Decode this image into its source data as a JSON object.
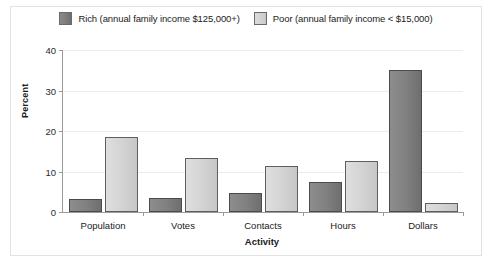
{
  "chart_data": {
    "type": "bar",
    "title": "",
    "xlabel": "Activity",
    "ylabel": "Percent",
    "ylim": [
      0,
      40
    ],
    "yticks": [
      0,
      10,
      20,
      30,
      40
    ],
    "ytick_labels": [
      "0",
      "10",
      "20",
      "30",
      "40"
    ],
    "grid": true,
    "legend_position": "top-center",
    "categories": [
      "Population",
      "Votes",
      "Contacts",
      "Hours",
      "Dollars"
    ],
    "series": [
      {
        "name": "Rich (annual family income $125,000+)",
        "color": "#7d7d7d",
        "values": [
          3.2,
          3.5,
          4.6,
          7.3,
          35.0
        ]
      },
      {
        "name": "Poor (annual family income < $15,000)",
        "color": "#d2d2d2",
        "values": [
          18.6,
          13.4,
          11.4,
          12.7,
          2.2
        ]
      }
    ]
  }
}
